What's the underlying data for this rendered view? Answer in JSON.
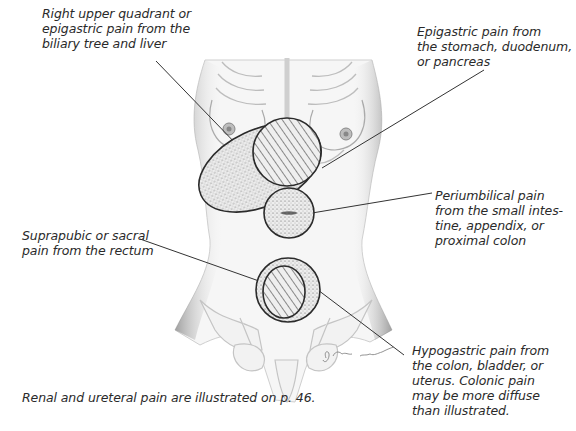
{
  "figure": {
    "type": "anatomical-illustration",
    "signature": "S. Shapiro Baumann"
  },
  "labels": {
    "ruq": "Right upper quadrant or\nepigastric pain from the\nbiliary tree and liver",
    "epigastric": "Epigastric pain from\nthe stomach, duodenum,\nor pancreas",
    "periumbilical": "Periumbilical pain\nfrom the small intes-\ntine, appendix, or\nproximal colon",
    "suprapubic": "Suprapubic or sacral\npain from the rectum",
    "hypogastric": "Hypogastric pain from\nthe colon, bladder, or\nuterus. Colonic pain\nmay be more diffuse\nthan illustrated."
  },
  "footnote": "Renal and ureteral pain are illustrated on p. 46.",
  "regions": [
    {
      "id": "ruq",
      "fill": "stipple",
      "shape": "ellipse"
    },
    {
      "id": "epigastric",
      "fill": "hatched",
      "shape": "ellipse"
    },
    {
      "id": "periumbilical",
      "fill": "stipple",
      "shape": "circle"
    },
    {
      "id": "hypogastric",
      "fill": "stipple",
      "shape": "circle"
    },
    {
      "id": "suprapubic",
      "fill": "hatched",
      "shape": "ellipse"
    }
  ],
  "colors": {
    "outline": "#2b2b2b",
    "text": "#2a2a2a",
    "shading": "#c8c8c8",
    "background": "#ffffff"
  }
}
